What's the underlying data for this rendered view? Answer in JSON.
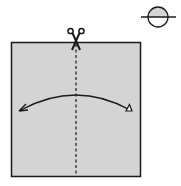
{
  "diagram": {
    "type": "origami-step",
    "paper_color": "#d4d4d4",
    "line_color": "#1a1a1a",
    "symbols": {
      "cut": "scissors-icon",
      "fold_line": "valley-fold-dashed-line",
      "action": "fold-and-unfold-arrow",
      "indicator": "half-shaded-circle-icon"
    }
  }
}
